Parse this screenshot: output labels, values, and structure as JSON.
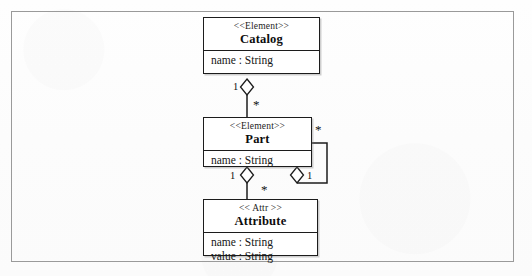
{
  "diagram": {
    "frame": {
      "name": "diagram-frame",
      "border_color": "#9a9a9a"
    },
    "background_color": "#fdfdfd",
    "line_color": "#1c1c1c",
    "classes": [
      {
        "id": "catalog",
        "stereotype": "<<Element>>",
        "name": "Catalog",
        "attributes": [
          "name : String"
        ]
      },
      {
        "id": "part",
        "stereotype": "<<Element>>",
        "name": "Part",
        "attributes": [
          "name : String"
        ]
      },
      {
        "id": "attribute",
        "stereotype": "<< Attr >>",
        "name": "Attribute",
        "attributes": [
          "name : String",
          "value : String"
        ]
      }
    ],
    "relationships": [
      {
        "id": "catalog-part",
        "type": "aggregation",
        "from": "Catalog",
        "to": "Part",
        "from_multiplicity": "1",
        "to_multiplicity": "*"
      },
      {
        "id": "part-attribute",
        "type": "aggregation",
        "from": "Part",
        "to": "Attribute",
        "from_multiplicity": "1",
        "to_multiplicity": "*"
      },
      {
        "id": "part-part",
        "type": "aggregation",
        "from": "Part",
        "to": "Part",
        "from_multiplicity": "1",
        "to_multiplicity": "*"
      }
    ],
    "multiplicity_labels": {
      "catalog_end": "1",
      "catalog_part_many": "*",
      "part_attr_one": "1",
      "part_attr_many": "*",
      "part_self_many": "*",
      "part_self_one": "1"
    }
  }
}
